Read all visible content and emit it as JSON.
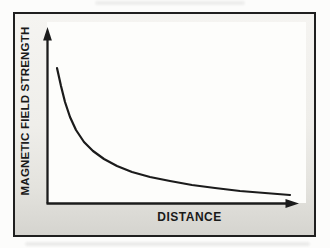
{
  "figure": {
    "ylabel": "MAGNETIC FIELD STRENGTH",
    "xlabel": "DISTANCE"
  },
  "colors": {
    "frame_border": "#1f1f1f",
    "mat_background_top": "#f5f4f1",
    "mat_background_bottom": "#d5d4cf",
    "plot_background": "#fdfdfb",
    "axis": "#1b1b1b",
    "curve": "#1b1b1b",
    "label_text": "#191919"
  },
  "chart_data": {
    "type": "line",
    "title": "",
    "xlabel": "DISTANCE",
    "ylabel": "MAGNETIC FIELD STRENGTH",
    "qualitative": true,
    "grid": false,
    "legend": false,
    "axes": {
      "x": {
        "tick_labels": "none",
        "arrowhead": true,
        "origin_px": [
          47,
          203
        ],
        "tip_px": [
          299,
          203
        ]
      },
      "y": {
        "tick_labels": "none",
        "arrowhead": true,
        "origin_px": [
          47,
          203
        ],
        "tip_px": [
          47,
          27
        ]
      }
    },
    "relationship": "inverse decay: magnetic field strength falls steeply at small distance then levels off asymptotically toward the distance axis",
    "series": [
      {
        "name": "magnetic field strength vs distance",
        "points_px": [
          [
            57,
            68
          ],
          [
            61,
            86
          ],
          [
            65,
            102
          ],
          [
            70,
            117
          ],
          [
            76,
            130
          ],
          [
            84,
            142
          ],
          [
            93,
            151
          ],
          [
            104,
            159
          ],
          [
            117,
            166
          ],
          [
            132,
            172
          ],
          [
            150,
            177
          ],
          [
            170,
            181
          ],
          [
            192,
            185
          ],
          [
            215,
            188
          ],
          [
            240,
            191
          ],
          [
            265,
            193
          ],
          [
            290,
            195
          ]
        ],
        "distance_rel": [
          0.04,
          0.06,
          0.07,
          0.09,
          0.12,
          0.15,
          0.18,
          0.23,
          0.28,
          0.34,
          0.41,
          0.49,
          0.58,
          0.67,
          0.77,
          0.87,
          0.96
        ],
        "strength_rel": [
          0.77,
          0.66,
          0.57,
          0.49,
          0.41,
          0.35,
          0.3,
          0.25,
          0.21,
          0.18,
          0.15,
          0.13,
          0.1,
          0.09,
          0.07,
          0.06,
          0.04
        ]
      }
    ]
  }
}
